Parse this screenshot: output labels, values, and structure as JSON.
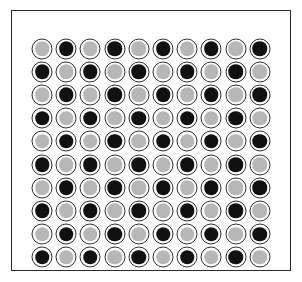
{
  "figure": {
    "background_color": "#ffffff",
    "frame": {
      "name": "outer-frame",
      "stroke_color": "#2b2b2b",
      "stroke_width_px": 1.4,
      "fill_color": "#ffffff"
    },
    "token_styles": {
      "ring_color": "#2f2f2f",
      "ring_width_px": 1.5,
      "ring_gap_color": "#ffffff",
      "light_fill": "#b7b7b7",
      "dark_fill": "#111111",
      "outer_diameter_px": 21,
      "inner_diameter_px": 14.5
    }
  },
  "chart_data": {
    "type": "heatmap",
    "subtitle": "",
    "xlabel": "",
    "ylabel": "",
    "rows": 10,
    "columns": 10,
    "grid": true,
    "legend_position": "none",
    "value_labels": {
      "0": "light",
      "1": "dark"
    },
    "colors": {
      "light": "#b7b7b7",
      "dark": "#111111"
    },
    "categories_x": [
      "1",
      "2",
      "3",
      "4",
      "5",
      "6",
      "7",
      "8",
      "9",
      "10"
    ],
    "categories_y": [
      "1",
      "2",
      "3",
      "4",
      "5",
      "6",
      "7",
      "8",
      "9",
      "10"
    ],
    "values": [
      [
        0,
        1,
        0,
        1,
        0,
        1,
        0,
        1,
        0,
        1
      ],
      [
        1,
        0,
        1,
        0,
        1,
        0,
        1,
        0,
        1,
        0
      ],
      [
        0,
        1,
        0,
        1,
        0,
        1,
        0,
        1,
        0,
        1
      ],
      [
        1,
        0,
        1,
        0,
        1,
        0,
        1,
        0,
        1,
        0
      ],
      [
        0,
        1,
        0,
        1,
        0,
        1,
        0,
        1,
        0,
        1
      ],
      [
        1,
        0,
        1,
        0,
        1,
        0,
        1,
        0,
        1,
        0
      ],
      [
        0,
        1,
        0,
        1,
        0,
        1,
        0,
        1,
        0,
        1
      ],
      [
        1,
        0,
        1,
        0,
        1,
        0,
        1,
        0,
        1,
        0
      ],
      [
        0,
        1,
        0,
        1,
        0,
        1,
        0,
        1,
        0,
        1
      ],
      [
        1,
        0,
        1,
        0,
        1,
        0,
        1,
        0,
        1,
        0
      ]
    ]
  }
}
